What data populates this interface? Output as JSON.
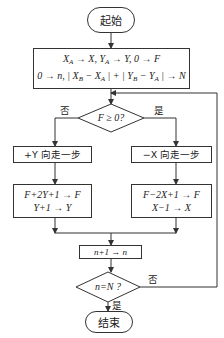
{
  "flowchart": {
    "start": {
      "label": "起始"
    },
    "init": {
      "line1": "X_A → X, Y_A → Y, 0 → F",
      "line2": "0 → n, | X_B − X_A | + | Y_B − Y_A | → N"
    },
    "decision_f": {
      "label": "F ≥ 0?",
      "no_label": "否",
      "yes_label": "是"
    },
    "left_step": {
      "label": "+Y 向走一步"
    },
    "right_step": {
      "label": "−X 向走一步"
    },
    "left_update": {
      "line1": "F+2Y+1 → F",
      "line2": "Y+1 → Y"
    },
    "right_update": {
      "line1": "F−2X+1 → F",
      "line2": "X−1 → X"
    },
    "increment": {
      "label": "n+1 → n"
    },
    "decision_n": {
      "label": "n=N ?",
      "no_label": "否",
      "yes_label": "是"
    },
    "end": {
      "label": "结束"
    }
  },
  "colors": {
    "line": "#333333",
    "background": "#ffffff"
  }
}
